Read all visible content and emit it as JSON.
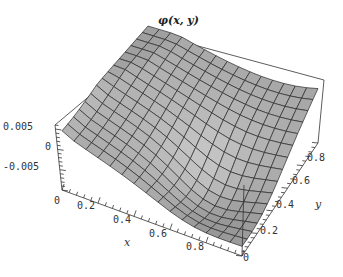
{
  "chart_data": {
    "type": "surface3d",
    "xlabel": "x",
    "ylabel": "y",
    "zlabel": "",
    "x_ticks": [
      "0",
      "0.2",
      "0.4",
      "0.6",
      "0.8"
    ],
    "y_ticks": [
      "0",
      "0.2",
      "0.4",
      "0.6",
      "0.8"
    ],
    "z_ticks": [
      "0.005",
      "0",
      "-0.005"
    ],
    "xlim": [
      0,
      1
    ],
    "ylim": [
      0,
      1
    ],
    "zlim": [
      -0.009,
      0.007
    ],
    "grid_divisions": 15,
    "surface_color": "#9a9a9a",
    "mesh_color": "#2a2a2a"
  },
  "labels": {
    "title": "φ(x, y)",
    "x_axis": "x",
    "y_axis": "y",
    "z_0005": "0.005",
    "z_0": "0",
    "z_m0005": "-0.005",
    "x_0": "0",
    "x_02": "0.2",
    "x_04": "0.4",
    "x_06": "0.6",
    "x_08": "0.8",
    "y_0": "0",
    "y_02": "0.2",
    "y_04": "0.4",
    "y_06": "0.6",
    "y_08": "0.8"
  }
}
